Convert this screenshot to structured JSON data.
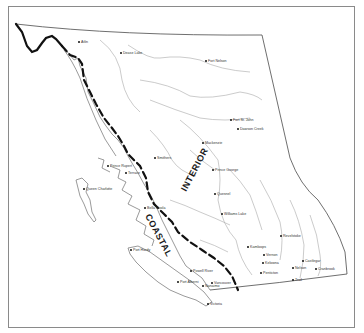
{
  "map": {
    "subject": "British Columbia coastal / interior division",
    "region_labels": {
      "coastal": "COASTAL",
      "interior": "INTERIOR"
    },
    "legend_colors": {
      "divide_line": "#111111",
      "coastline": "#6e6e6e",
      "rivers": "#a8a8a8",
      "frame": "#8a8a8a"
    },
    "towns": [
      {
        "name": "Atlin",
        "x": 79,
        "y": 42
      },
      {
        "name": "Dease Lake",
        "x": 121,
        "y": 53
      },
      {
        "name": "Fort Nelson",
        "x": 206,
        "y": 61
      },
      {
        "name": "Fort St. John",
        "x": 231,
        "y": 120
      },
      {
        "name": "Dawson Creek",
        "x": 238,
        "y": 129
      },
      {
        "name": "Mackenzie",
        "x": 203,
        "y": 143
      },
      {
        "name": "Smithers",
        "x": 155,
        "y": 158
      },
      {
        "name": "Prince George",
        "x": 213,
        "y": 170
      },
      {
        "name": "Prince Rupert",
        "x": 108,
        "y": 166
      },
      {
        "name": "Terrace",
        "x": 126,
        "y": 173
      },
      {
        "name": "Queen Charlotte",
        "x": 84,
        "y": 189
      },
      {
        "name": "Quesnel",
        "x": 215,
        "y": 194
      },
      {
        "name": "Bella Coola",
        "x": 145,
        "y": 208
      },
      {
        "name": "Williams Lake",
        "x": 222,
        "y": 214
      },
      {
        "name": "Revelstoke",
        "x": 281,
        "y": 236
      },
      {
        "name": "Kamloops",
        "x": 248,
        "y": 247
      },
      {
        "name": "Vernon",
        "x": 264,
        "y": 255
      },
      {
        "name": "Kelowna",
        "x": 263,
        "y": 263
      },
      {
        "name": "Penticton",
        "x": 261,
        "y": 273
      },
      {
        "name": "Nelson",
        "x": 293,
        "y": 268
      },
      {
        "name": "Castlegar",
        "x": 303,
        "y": 261
      },
      {
        "name": "Cranbrook",
        "x": 316,
        "y": 269
      },
      {
        "name": "Trail",
        "x": 293,
        "y": 280
      },
      {
        "name": "Port Hardy",
        "x": 131,
        "y": 250
      },
      {
        "name": "Powell River",
        "x": 191,
        "y": 271
      },
      {
        "name": "Port Alberni",
        "x": 178,
        "y": 282
      },
      {
        "name": "Nanaimo",
        "x": 203,
        "y": 286
      },
      {
        "name": "Vancouver",
        "x": 212,
        "y": 283
      },
      {
        "name": "Victoria",
        "x": 208,
        "y": 304
      }
    ]
  }
}
